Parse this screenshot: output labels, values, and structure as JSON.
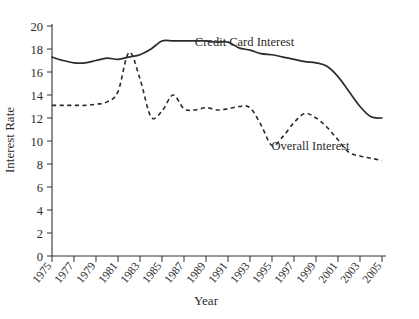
{
  "chart_data": {
    "type": "line",
    "title": "",
    "xlabel": "Year",
    "ylabel": "Interest Rate",
    "xlim": [
      1975,
      2005
    ],
    "ylim": [
      0,
      20
    ],
    "grid": false,
    "legend_position": "inline-annotation",
    "xticks": [
      "1975",
      "1977",
      "1979",
      "1981",
      "1983",
      "1985",
      "1987",
      "1989",
      "1991",
      "1993",
      "1995",
      "1997",
      "1999",
      "2001",
      "2003",
      "2005"
    ],
    "yticks": [
      "0",
      "2",
      "4",
      "6",
      "8",
      "10",
      "12",
      "14",
      "16",
      "18",
      "20"
    ],
    "x": [
      1975,
      1976,
      1977,
      1978,
      1979,
      1980,
      1981,
      1982,
      1983,
      1984,
      1985,
      1986,
      1987,
      1988,
      1989,
      1990,
      1991,
      1992,
      1993,
      1994,
      1995,
      1996,
      1997,
      1998,
      1999,
      2000,
      2001,
      2002,
      2003,
      2004,
      2005
    ],
    "series": [
      {
        "name": "Credit Card Interest",
        "style": "solid",
        "color": "#2b2b2b",
        "values": [
          17.3,
          17.0,
          16.8,
          16.8,
          17.0,
          17.2,
          17.1,
          17.3,
          17.5,
          18.0,
          18.7,
          18.7,
          18.7,
          18.7,
          18.7,
          18.6,
          18.6,
          18.1,
          17.9,
          17.6,
          17.5,
          17.3,
          17.1,
          16.9,
          16.8,
          16.5,
          15.6,
          14.3,
          13.0,
          12.1,
          12.0
        ]
      },
      {
        "name": "Overall Interest",
        "style": "dashed",
        "color": "#2b2b2b",
        "values": [
          13.1,
          13.1,
          13.1,
          13.1,
          13.2,
          13.4,
          14.3,
          17.7,
          15.4,
          12.1,
          12.6,
          14.0,
          12.8,
          12.7,
          12.9,
          12.7,
          12.8,
          13.0,
          12.9,
          11.4,
          9.6,
          10.4,
          11.6,
          12.4,
          12.0,
          11.2,
          10.1,
          9.0,
          8.7,
          8.5,
          8.3
        ]
      }
    ],
    "annotations": [
      {
        "text": "Credit Card Interest",
        "x": 1992.5,
        "y": 18.3
      },
      {
        "text": "Overall Interest",
        "x": 1998.5,
        "y": 9.2
      }
    ]
  },
  "axis": {
    "y_title": "Interest Rate",
    "x_title": "Year"
  }
}
